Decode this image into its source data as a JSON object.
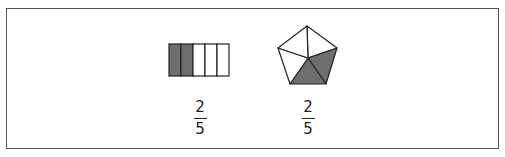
{
  "figures": [
    {
      "type": "rectangle-bar",
      "parts": 5,
      "shaded_parts": [
        0,
        1
      ],
      "fraction": {
        "numerator": "2",
        "denominator": "5"
      }
    },
    {
      "type": "pentagon",
      "parts": 5,
      "shaded_parts": [
        "bottom",
        "bottom-right"
      ],
      "fraction": {
        "numerator": "2",
        "denominator": "5"
      }
    }
  ],
  "colors": {
    "shade": "#6e6e6e",
    "stroke": "#222222",
    "border": "#555555"
  }
}
